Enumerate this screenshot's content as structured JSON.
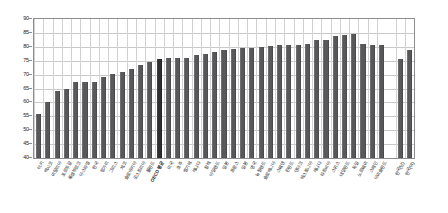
{
  "chart_data": {
    "type": "bar",
    "title": "",
    "subtitle": "",
    "xlabel": "",
    "ylabel": "",
    "ylim": [
      40,
      90
    ],
    "ytick_step": 5,
    "yticks": [
      90,
      85,
      80,
      75,
      70,
      65,
      60,
      55,
      50,
      45,
      40
    ],
    "grid": true,
    "grid_axis": "both",
    "legend": "none",
    "bar_color": "#58585a",
    "highlight_color": "#2e2e30",
    "highlight_category": "OECD 평균",
    "gap_before_index": 38,
    "categories": [
      "터키",
      "멕시코",
      "이탈리아",
      "포르투갈",
      "룩셈부르크",
      "아스라엘",
      "한국",
      "헝가리",
      "그리스",
      "체코",
      "슬로바키아",
      "오스트리아",
      "폴란드",
      "OECD 평균",
      "미국",
      "호주",
      "벨기에",
      "캐나다",
      "칠레",
      "아일랜드",
      "일본",
      "프랑스",
      "일본",
      "영국",
      "뉴질랜드",
      "슬로베니아",
      "스웨덴",
      "핀란드",
      "덴마크",
      "에스토니아",
      "캐나다",
      "라트비아",
      "스위스",
      "네덜란드",
      "독일",
      "노르웨이",
      "스페인",
      "아이슬란드"
    ],
    "values": [
      56.0,
      60.2,
      64.1,
      64.8,
      67.2,
      67.4,
      67.5,
      69.2,
      70.1,
      71.1,
      72.1,
      73.6,
      74.7,
      75.7,
      76.0,
      75.9,
      76.1,
      76.9,
      77.5,
      78.2,
      78.8,
      79.3,
      79.7,
      79.6,
      80.1,
      80.3,
      80.6,
      80.7,
      80.8,
      81.0,
      82.4,
      82.6,
      83.8,
      84.4,
      84.8,
      80.9,
      80.8,
      80.7
    ],
    "extra_categories": [
      "한국(남)",
      "한국(여)"
    ],
    "extra_values": [
      75.6,
      78.7
    ]
  },
  "axis": {
    "y_max_label": "90",
    "y_min_label": "40"
  }
}
